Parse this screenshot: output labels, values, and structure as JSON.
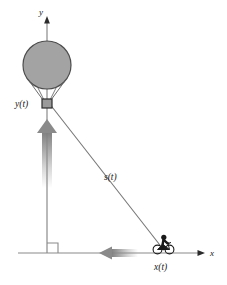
{
  "figure": {
    "background_color": "#ffffff",
    "width": 227,
    "height": 285
  },
  "axes": {
    "y_axis_label": "y",
    "x_axis_label": "x",
    "axis_color": "#808080",
    "origin_right_angle_marker": true
  },
  "labels": {
    "balloon_height": "y(t)",
    "cyclist_position": "x(t)",
    "hypotenuse": "s(t)"
  },
  "objects": {
    "balloon": {
      "name": "hot-air-balloon",
      "envelope_fill": "#a0a0a0",
      "envelope_stroke": "#4d4d4d",
      "basket_fill": "#9a9a9a",
      "basket_stroke": "#333333"
    },
    "cyclist": {
      "name": "cyclist-on-bicycle",
      "color": "#1a1a1a"
    },
    "hypotenuse_line": {
      "color": "#777777"
    }
  },
  "motion_arrows": {
    "balloon_direction": "up",
    "cyclist_direction": "left",
    "arrow_color": "#8c8c8c"
  }
}
